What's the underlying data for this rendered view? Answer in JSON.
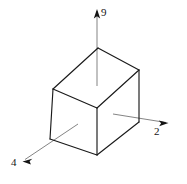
{
  "figure": {
    "kind": "3d-box-with-axes",
    "background_color": "#ffffff",
    "edge_color": "#1a1a1a",
    "axis_color": "#6e6e6e",
    "label_color": "#141414",
    "axes": [
      {
        "id": "up",
        "label": "9",
        "direction": "up",
        "icon": "arrow-up-icon",
        "from": [
          97,
          86
        ],
        "to": [
          97,
          11
        ]
      },
      {
        "id": "right",
        "label": "2",
        "direction": "right-down",
        "icon": "arrow-right-icon",
        "from": [
          113,
          114
        ],
        "to": [
          166,
          122
        ]
      },
      {
        "id": "left",
        "label": "4",
        "direction": "left-down",
        "icon": "arrow-down-left-icon",
        "from": [
          78,
          124
        ],
        "to": [
          24,
          160
        ]
      }
    ],
    "vertices": {
      "top_back": [
        98,
        48
      ],
      "top_right": [
        139,
        70
      ],
      "top_front": [
        97,
        108
      ],
      "top_left": [
        53,
        89
      ],
      "bottom_front": [
        97,
        155
      ],
      "bottom_left": [
        50,
        139
      ],
      "bottom_right": [
        139,
        122
      ]
    },
    "faces": [
      {
        "name": "top-face",
        "points": "98,48 139,70 97,108 53,89"
      },
      {
        "name": "left-front-face",
        "points": "53,89 97,108 97,155 50,139"
      },
      {
        "name": "right-front-face",
        "points": "97,108 139,70 139,122 97,155"
      }
    ]
  }
}
